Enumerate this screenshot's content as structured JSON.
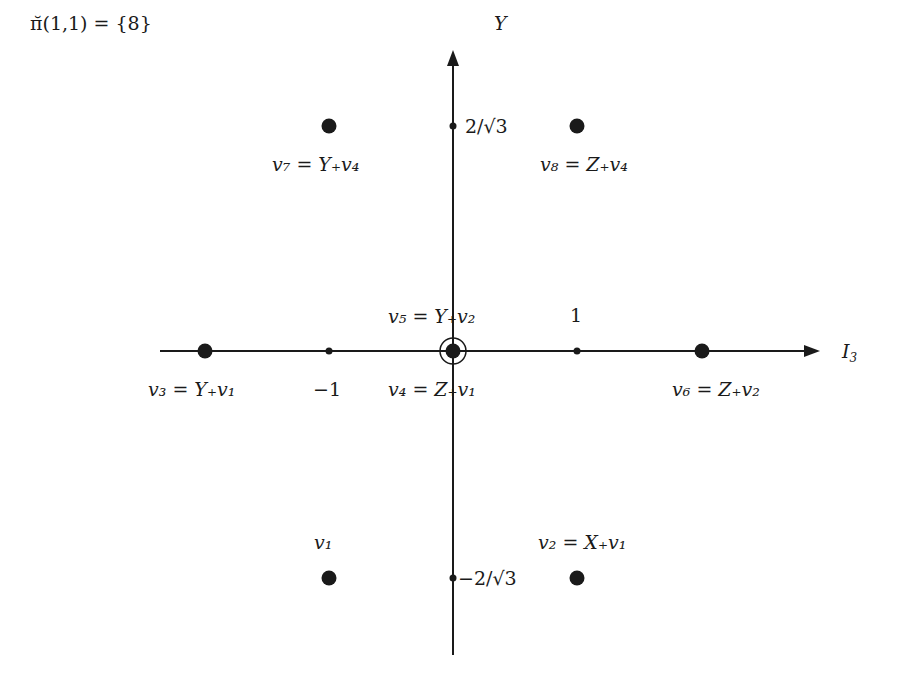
{
  "title": "π̆(1,1) = {8}",
  "axes": {
    "x_label": "I₃",
    "y_label": "Y",
    "x_ticks": [
      {
        "value": -1,
        "label": "−1"
      },
      {
        "value": 1,
        "label": "1"
      }
    ],
    "y_ticks": [
      {
        "value": 1.1547,
        "label": "2/√3"
      },
      {
        "value": -1.1547,
        "label": "−2/√3"
      }
    ]
  },
  "weights": [
    {
      "id": "v1",
      "label": "v₁",
      "x": -1,
      "y": -1.1547
    },
    {
      "id": "v2",
      "label": "v₂ = X₊v₁",
      "x": 1,
      "y": -1.1547
    },
    {
      "id": "v3",
      "label": "v₃ = Y₊v₁",
      "x": -2,
      "y": 0
    },
    {
      "id": "v4",
      "label": "v₄ = Z₊v₁",
      "x": 0,
      "y": 0
    },
    {
      "id": "v5",
      "label": "v₅ = Y₊v₂",
      "x": 0,
      "y": 0
    },
    {
      "id": "v6",
      "label": "v₆ = Z₊v₂",
      "x": 2,
      "y": 0
    },
    {
      "id": "v7",
      "label": "v₇ = Y₊v₄",
      "x": -1,
      "y": 1.1547
    },
    {
      "id": "v8",
      "label": "v₈ = Z₊v₄",
      "x": 1,
      "y": 1.1547
    }
  ],
  "text": {
    "title": "π̆(1,1) = {8}",
    "y_axis": "Y",
    "x_axis": "I",
    "x_axis_sub": "3",
    "tick_pos": "2/√3",
    "tick_neg": "−2/√3",
    "tick_m1": "−1",
    "tick_p1": "1",
    "v1": "v₁",
    "v2": "v₂ = X₊v₁",
    "v3": "v₃ = Y₊v₁",
    "v4": "v₄ = Z₊v₁",
    "v5": "v₅ = Y₊v₂",
    "v6": "v₆ = Z₊v₂",
    "v7": "v₇ = Y₊v₄",
    "v8": "v₈ = Z₊v₄"
  }
}
